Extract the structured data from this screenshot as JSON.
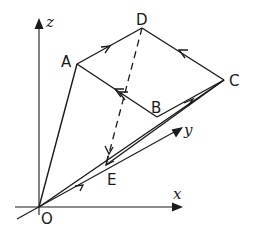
{
  "diagram": {
    "type": "3d-vector-path-figure",
    "axes": {
      "x_label": "x",
      "y_label": "y",
      "z_label": "z"
    },
    "points": {
      "O": "O",
      "A": "A",
      "B": "B",
      "C": "C",
      "D": "D",
      "E": "E"
    },
    "edges": [
      {
        "from": "O",
        "to": "A",
        "style": "solid"
      },
      {
        "from": "A",
        "to": "D",
        "style": "solid",
        "arrow": "toward D"
      },
      {
        "from": "C",
        "to": "D",
        "style": "solid",
        "arrow": "toward D"
      },
      {
        "from": "B",
        "to": "A",
        "style": "solid",
        "arrow": "toward A (double)"
      },
      {
        "from": "B",
        "to": "C",
        "style": "solid",
        "arrow": "toward C"
      },
      {
        "from": "O",
        "to": "C",
        "style": "solid",
        "arrow": "toward C"
      },
      {
        "from": "C",
        "to": "E",
        "style": "solid",
        "arrow": "toward E"
      },
      {
        "from": "D",
        "to": "E",
        "style": "dashed",
        "arrow": "toward E"
      }
    ],
    "colors": {
      "line": "#1a1a1a",
      "background": "#ffffff"
    }
  }
}
